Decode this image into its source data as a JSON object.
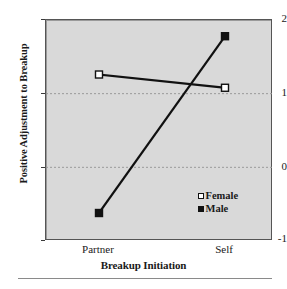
{
  "chart_data": {
    "type": "line",
    "title": "",
    "subtitle": "",
    "xlabel": "Breakup Initiation",
    "ylabel": "Positive Adjustment to Breakup",
    "categories": [
      "Partner",
      "Self"
    ],
    "series": [
      {
        "name": "Female",
        "marker": "open-square",
        "values": [
          1.26,
          1.08
        ]
      },
      {
        "name": "Male",
        "marker": "filled-square",
        "values": [
          -0.62,
          1.78
        ]
      }
    ],
    "ylim": [
      -1,
      2
    ],
    "yticks": [
      2,
      1,
      0,
      -1
    ],
    "ytick_labels": [
      "2",
      "1",
      "0",
      "-1"
    ],
    "gridlines": {
      "y": [
        1,
        0
      ],
      "style": "dashed",
      "color": "#9a9a9a"
    },
    "grid": true,
    "legend_position": "inside-bottom-right",
    "plot_background": "#d9d9d9",
    "line_color": "#111111",
    "frame_color": "#555555"
  },
  "axes": {
    "y_title": "Positive Adjustment to Breakup",
    "x_title": "Breakup Initiation",
    "y_ticks": [
      {
        "label": "2"
      },
      {
        "label": "1"
      },
      {
        "label": "0"
      },
      {
        "label": "-1"
      }
    ],
    "x_ticks": [
      {
        "label": "Partner"
      },
      {
        "label": "Self"
      }
    ]
  },
  "legend": {
    "items": [
      {
        "label": "Female",
        "marker": "open-square"
      },
      {
        "label": "Male",
        "marker": "filled-square"
      }
    ]
  }
}
